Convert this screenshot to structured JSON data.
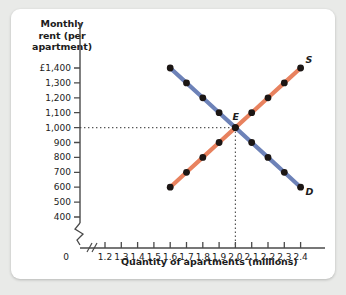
{
  "chart_data": {
    "type": "line",
    "title": "",
    "ylabel": "Monthly rent (per apartment)",
    "xlabel": "Quantity of apartments (millions)",
    "ylabel_lines": [
      "Monthly",
      "rent (per",
      "apartment)"
    ],
    "x": [
      1.6,
      1.7,
      1.8,
      1.9,
      2.0,
      2.1,
      2.2,
      2.3,
      2.4
    ],
    "xticks": [
      "0",
      "1.2",
      "1.3",
      "1.4",
      "1.5",
      "1.6",
      "1.7",
      "1.8",
      "1.9",
      "2.0",
      "2.1",
      "2.2",
      "2.3",
      "2.4"
    ],
    "xtick_values": [
      0,
      1.2,
      1.3,
      1.4,
      1.5,
      1.6,
      1.7,
      1.8,
      1.9,
      2.0,
      2.1,
      2.2,
      2.3,
      2.4
    ],
    "yticks": [
      "400",
      "500",
      "600",
      "700",
      "800",
      "900",
      "1,000",
      "1,100",
      "1,200",
      "1,300",
      "£1,400"
    ],
    "ytick_values": [
      400,
      500,
      600,
      700,
      800,
      900,
      1000,
      1100,
      1200,
      1300,
      1400
    ],
    "xlim": [
      1.15,
      2.45
    ],
    "ylim": [
      400,
      1400
    ],
    "axis_break_x": true,
    "axis_break_y": true,
    "grid": false,
    "legend": "inline-curve-labels",
    "currency_symbol": "£",
    "series": [
      {
        "name": "Demand",
        "label": "D",
        "color": "#6d82b8",
        "values": [
          1400,
          1300,
          1200,
          1100,
          1000,
          900,
          800,
          700,
          600
        ]
      },
      {
        "name": "Supply",
        "label": "S",
        "color": "#e8825f",
        "values": [
          600,
          700,
          800,
          900,
          1000,
          1100,
          1200,
          1300,
          1400
        ]
      }
    ],
    "annotations": [
      {
        "label": "E",
        "name": "equilibrium-point",
        "x": 2.0,
        "y": 1000,
        "guide_lines": "dotted"
      }
    ]
  },
  "colors": {
    "demand": "#6d82b8",
    "supply": "#e8825f",
    "point": "#1c1614",
    "axis": "#4a4a4a",
    "panel_background": "#ffffff",
    "page_background": "#e9eae8"
  }
}
